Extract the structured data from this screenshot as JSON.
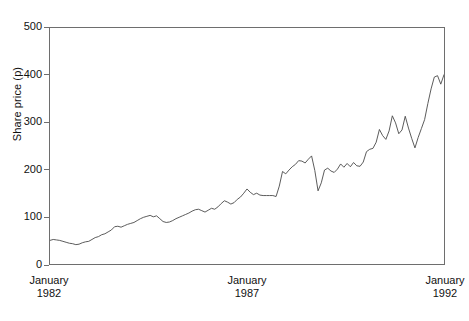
{
  "chart_data": {
    "type": "line",
    "title": "",
    "subtitle": "",
    "xlabel": "",
    "ylabel": "Share price (p)",
    "ylim": [
      0,
      500
    ],
    "yticks": [
      0,
      100,
      200,
      300,
      400,
      500
    ],
    "ytick_labels": [
      "0",
      "100",
      "200",
      "300",
      "400",
      "500"
    ],
    "xlim": [
      "January 1982",
      "January 1992"
    ],
    "xticks": [
      "January 1982",
      "January 1987",
      "January 1992"
    ],
    "xtick_labels": [
      {
        "month": "January",
        "year": "1982"
      },
      {
        "month": "January",
        "year": "1987"
      },
      {
        "month": "January",
        "year": "1992"
      }
    ],
    "grid": false,
    "legend": null,
    "annotations": [],
    "series": [
      {
        "name": "Share price",
        "units": "p",
        "frequency": "monthly",
        "start": "1982-01",
        "end": "1992-01",
        "n_points": 121,
        "values": [
          50,
          52,
          51,
          50,
          48,
          46,
          44,
          43,
          41,
          42,
          45,
          47,
          48,
          52,
          56,
          58,
          62,
          64,
          68,
          72,
          79,
          80,
          78,
          81,
          84,
          86,
          88,
          92,
          96,
          99,
          101,
          103,
          100,
          102,
          96,
          90,
          88,
          89,
          92,
          96,
          99,
          102,
          105,
          108,
          112,
          115,
          116,
          113,
          110,
          114,
          118,
          116,
          121,
          128,
          134,
          131,
          127,
          130,
          137,
          142,
          150,
          159,
          152,
          147,
          150,
          146,
          145,
          145,
          145,
          145,
          143,
          165,
          196,
          191,
          199,
          206,
          211,
          219,
          218,
          214,
          222,
          229,
          198,
          155,
          172,
          199,
          203,
          197,
          194,
          201,
          212,
          205,
          213,
          206,
          215,
          208,
          207,
          216,
          238,
          243,
          245,
          258,
          285,
          272,
          264,
          282,
          314,
          299,
          276,
          284,
          313,
          288,
          266,
          246,
          268,
          287,
          306,
          340,
          371,
          396,
          399,
          381,
          401
        ]
      }
    ]
  },
  "axes": {
    "y_label_text": "Share price (p)"
  }
}
